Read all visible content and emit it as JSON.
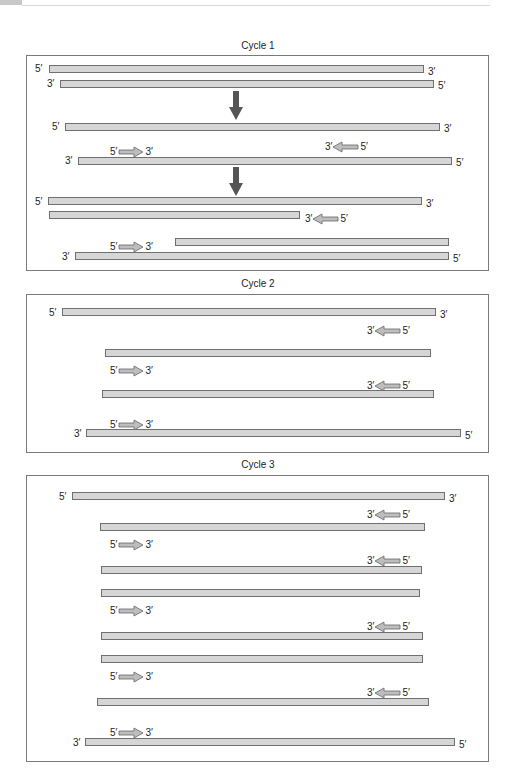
{
  "header": {
    "tab_color": "#c8c8c8"
  },
  "colors": {
    "strand_fill": "#d6d6d6",
    "strand_border": "#6f6f6f",
    "primer_fill": "#bdbdbd",
    "down_arrow": "#555555",
    "panel_border": "#7a7a7a"
  },
  "cycles": [
    {
      "title": "Cycle 1",
      "strands": [
        {
          "left_label": "5′",
          "right_label": "3′"
        },
        {
          "left_label": "3′",
          "right_label": "5′"
        },
        {
          "left_label": "5′",
          "right_label": "3′"
        },
        {
          "left_label": "3′",
          "right_label": "5′"
        },
        {
          "left_label": "5′",
          "right_label": "3′"
        },
        {
          "left_label": "",
          "right_label": ""
        },
        {
          "left_label": "",
          "right_label": ""
        },
        {
          "left_label": "3′",
          "right_label": "5′"
        }
      ],
      "primers": [
        {
          "direction": "left",
          "left_label": "3′",
          "right_label": "5′"
        },
        {
          "direction": "right",
          "left_label": "5′",
          "right_label": "3′"
        },
        {
          "direction": "left",
          "left_label": "3′",
          "right_label": "5′"
        },
        {
          "direction": "right",
          "left_label": "5′",
          "right_label": "3′"
        }
      ],
      "step_arrows": 2
    },
    {
      "title": "Cycle 2",
      "strands": [
        {
          "left_label": "5′",
          "right_label": "3′"
        },
        {
          "left_label": "",
          "right_label": ""
        },
        {
          "left_label": "",
          "right_label": ""
        },
        {
          "left_label": "3′",
          "right_label": "5′"
        }
      ],
      "primers": [
        {
          "direction": "left",
          "left_label": "3′",
          "right_label": "5′"
        },
        {
          "direction": "right",
          "left_label": "5′",
          "right_label": "3′"
        },
        {
          "direction": "left",
          "left_label": "3′",
          "right_label": "5′"
        },
        {
          "direction": "right",
          "left_label": "5′",
          "right_label": "3′"
        }
      ]
    },
    {
      "title": "Cycle 3",
      "strands": [
        {
          "left_label": "5′",
          "right_label": "3′"
        },
        {
          "left_label": "",
          "right_label": ""
        },
        {
          "left_label": "",
          "right_label": ""
        },
        {
          "left_label": "",
          "right_label": ""
        },
        {
          "left_label": "",
          "right_label": ""
        },
        {
          "left_label": "",
          "right_label": ""
        },
        {
          "left_label": "",
          "right_label": ""
        },
        {
          "left_label": "3′",
          "right_label": "5′"
        }
      ],
      "primers": [
        {
          "direction": "left",
          "left_label": "3′",
          "right_label": "5′"
        },
        {
          "direction": "right",
          "left_label": "5′",
          "right_label": "3′"
        },
        {
          "direction": "left",
          "left_label": "3′",
          "right_label": "5′"
        },
        {
          "direction": "right",
          "left_label": "5′",
          "right_label": "3′"
        },
        {
          "direction": "left",
          "left_label": "3′",
          "right_label": "5′"
        },
        {
          "direction": "right",
          "left_label": "5′",
          "right_label": "3′"
        },
        {
          "direction": "left",
          "left_label": "3′",
          "right_label": "5′"
        },
        {
          "direction": "right",
          "left_label": "5′",
          "right_label": "3′"
        }
      ]
    }
  ]
}
